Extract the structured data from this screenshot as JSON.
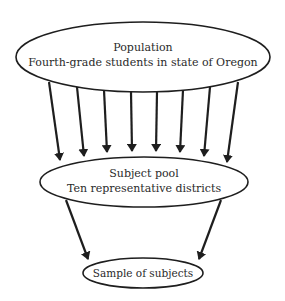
{
  "diagram": {
    "colors": {
      "stroke": "#1e1e1e",
      "background": "#ffffff",
      "text": "#2a2a2a"
    },
    "nodes": [
      {
        "id": "population",
        "title": "Population",
        "subtitle": "Fourth-grade students in state of Oregon"
      },
      {
        "id": "subject_pool",
        "title": "Subject pool",
        "subtitle": "Ten representative districts"
      },
      {
        "id": "sample",
        "title": "Sample of subjects"
      }
    ],
    "edges": [
      {
        "from": "population",
        "to": "subject_pool",
        "count": 8
      },
      {
        "from": "subject_pool",
        "to": "sample",
        "count": 2
      }
    ]
  }
}
